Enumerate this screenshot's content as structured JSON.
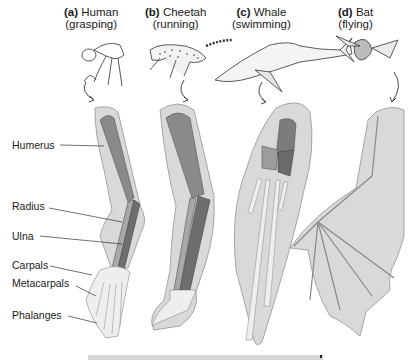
{
  "figure": {
    "panels": [
      {
        "letter": "(a)",
        "animal": "Human",
        "function": "(grasping)"
      },
      {
        "letter": "(b)",
        "animal": "Cheetah",
        "function": "(running)"
      },
      {
        "letter": "(c)",
        "animal": "Whale",
        "function": "(swimming)"
      },
      {
        "letter": "(d)",
        "animal": "Bat",
        "function": "(flying)"
      }
    ],
    "bone_labels": [
      "Humerus",
      "Radius",
      "Ulna",
      "Carpals",
      "Metacarpals",
      "Phalanges"
    ],
    "colors": {
      "limb_outline_fill": "#d9d9d9",
      "humerus": "#8a8a8a",
      "radius": "#a8a8a8",
      "ulna": "#6e6e6e",
      "hand_bones": "#eeeeee",
      "line": "#333333"
    }
  }
}
